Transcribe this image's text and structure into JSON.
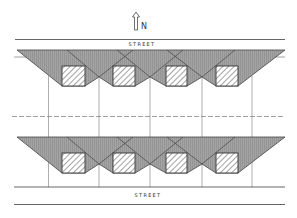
{
  "diagram": {
    "type": "site-plan",
    "north_arrow": {
      "label": "N",
      "icon": "north-arrow-icon"
    },
    "streets": [
      {
        "label": "STREET",
        "position": "top"
      },
      {
        "label": "STREET",
        "position": "bottom"
      }
    ],
    "rows": [
      {
        "name": "north-row",
        "buildings": 4,
        "shadow_fan": "shaded trapezoid with crossing diagonals"
      },
      {
        "name": "south-row",
        "buildings": 4,
        "shadow_fan": "shaded trapezoid with crossing diagonals"
      }
    ],
    "lot_lines": 5,
    "center_line": "dashed rear lot line",
    "colors": {
      "shade": "#9a9a9a",
      "line": "#444444",
      "hatch": "#555555",
      "background": "#ffffff"
    }
  }
}
